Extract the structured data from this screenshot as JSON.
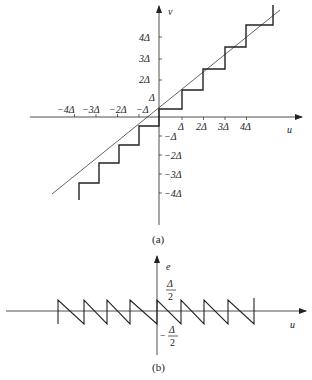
{
  "figure_a": {
    "caption": "(a)",
    "y_axis_label": "v",
    "x_axis_label": "u",
    "x_ticks_negative": [
      "−4Δ",
      "−3Δ",
      "−2Δ",
      "−Δ"
    ],
    "x_ticks_positive": [
      "Δ",
      "2Δ",
      "3Δ",
      "4Δ"
    ],
    "y_ticks_positive": [
      "Δ",
      "2Δ",
      "3Δ",
      "4Δ"
    ],
    "y_ticks_negative": [
      "−Δ",
      "−2Δ",
      "−3Δ",
      "−4Δ"
    ],
    "description": "Staircase quantizer characteristic v vs u with ideal linear reference line"
  },
  "figure_b": {
    "caption": "(b)",
    "y_axis_label": "e",
    "x_axis_label": "u",
    "upper_label_num": "Δ",
    "upper_label_den": "2",
    "lower_label_sign": "−",
    "lower_label_num": "Δ",
    "lower_label_den": "2",
    "description": "Sawtooth quantization error e vs u bounded between −Δ/2 and Δ/2"
  },
  "colors": {
    "line": "#222222",
    "background": "#ffffff"
  }
}
